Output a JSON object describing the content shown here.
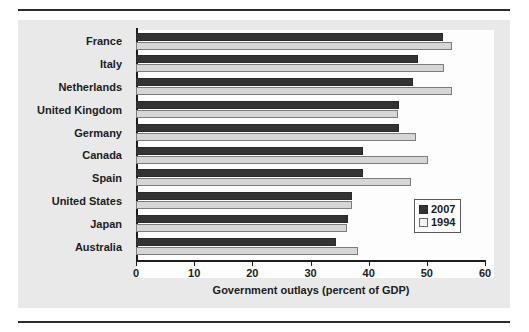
{
  "figure": {
    "panel_background": "#e9e9e9",
    "plot_background": "#fdfdfd"
  },
  "legend": {
    "position": "inside-bottom-right",
    "entries": [
      {
        "label": "2007",
        "color": "#333333"
      },
      {
        "label": "1994",
        "color": "#f2f2f2"
      }
    ]
  },
  "chart_data": {
    "type": "bar",
    "orientation": "horizontal",
    "title": "",
    "xlabel": "Government outlays (percent of GDP)",
    "ylabel": "",
    "xlim": [
      0,
      60
    ],
    "xticks": [
      0,
      10,
      20,
      30,
      40,
      50,
      60
    ],
    "xticklabels": [
      "0",
      "10",
      "20",
      "30",
      "40",
      "50",
      "60"
    ],
    "grid": false,
    "categories": [
      "France",
      "Italy",
      "Netherlands",
      "United Kingdom",
      "Germany",
      "Canada",
      "Spain",
      "United States",
      "Japan",
      "Australia"
    ],
    "series": [
      {
        "name": "2007",
        "color": "#333333",
        "values": [
          52.8,
          48.4,
          47.6,
          45.2,
          45.2,
          39.1,
          39.0,
          37.2,
          36.5,
          34.4
        ]
      },
      {
        "name": "1994",
        "color": "#d6d6d6",
        "values": [
          54.4,
          53.0,
          54.4,
          45.0,
          48.2,
          50.2,
          47.3,
          37.1,
          36.3,
          38.1
        ]
      }
    ]
  }
}
